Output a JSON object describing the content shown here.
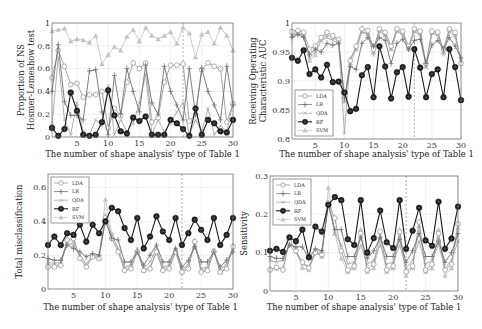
{
  "chart_data": [
    {
      "type": "line",
      "panel": "top-left",
      "title": "",
      "xlabel": "The number of shape analysis' type of Table 1",
      "ylabel": [
        "Proportion of NS",
        "Hosmer-Lemeshow test"
      ],
      "xlim": [
        1,
        30
      ],
      "ylim": [
        0,
        1
      ],
      "xticks": [
        5,
        10,
        15,
        20,
        25,
        30
      ],
      "yticks": [
        0,
        0.2,
        0.4,
        0.6,
        0.8,
        1
      ],
      "ytick_labels": [
        "0",
        "0.2",
        "0.4",
        "0.6",
        "0.8",
        "1"
      ],
      "grid": true,
      "vline_x": 22,
      "legend": null,
      "x": [
        1,
        2,
        3,
        4,
        5,
        6,
        7,
        8,
        9,
        10,
        11,
        12,
        13,
        14,
        15,
        16,
        17,
        18,
        19,
        20,
        21,
        22,
        23,
        24,
        25,
        26,
        27,
        28,
        29,
        30
      ],
      "series": [
        {
          "name": "LDA",
          "values": [
            0.52,
            0.76,
            0.62,
            0.46,
            0.47,
            0.35,
            0.37,
            0.37,
            0.4,
            0.08,
            0.25,
            0.19,
            0.48,
            0.65,
            0.6,
            0.65,
            0.13,
            0.17,
            0.48,
            0.63,
            0.63,
            0.64,
            0.14,
            0.2,
            0.59,
            0.65,
            0.62,
            0.6,
            0.13,
            0.29
          ]
        },
        {
          "name": "LR",
          "values": [
            0.4,
            0.81,
            0.31,
            0.19,
            0.19,
            0.15,
            0.58,
            0.59,
            0.22,
            0.02,
            0.54,
            0.2,
            0.6,
            0.4,
            0.22,
            0.63,
            0.3,
            0.2,
            0.62,
            0.4,
            0.28,
            0.15,
            0.6,
            0.2,
            0.6,
            0.4,
            0.28,
            0.15,
            0.62,
            0.28
          ]
        },
        {
          "name": "QDA",
          "values": [
            0.1,
            0.7,
            0.15,
            0.02,
            0.3,
            0.05,
            0.02,
            0.15,
            0.1,
            0.45,
            0.02,
            0.15,
            0.05,
            0.12,
            0.3,
            0.55,
            0.02,
            0.15,
            0.05,
            0.12,
            0.22,
            0.3,
            0.02,
            0.15,
            0.05,
            0.25,
            0.02,
            0.1,
            0.05,
            0.3
          ]
        },
        {
          "name": "RF",
          "values": [
            0.08,
            0.01,
            0.07,
            0.39,
            0.23,
            0.02,
            0.01,
            0.02,
            0.13,
            0.41,
            0.19,
            0.05,
            0.03,
            0.17,
            0.14,
            0.18,
            0.02,
            0.02,
            0.02,
            0.15,
            0.12,
            0.07,
            0.01,
            0.25,
            0.02,
            0.15,
            0.12,
            0.05,
            0.04,
            0.15
          ]
        },
        {
          "name": "SVM",
          "values": [
            0.93,
            0.94,
            0.95,
            0.84,
            0.86,
            0.85,
            0.83,
            0.89,
            0.64,
            0.72,
            0.79,
            0.76,
            0.88,
            0.94,
            0.84,
            0.96,
            0.89,
            0.86,
            0.89,
            0.92,
            0.82,
            0.96,
            0.91,
            0.7,
            0.9,
            0.92,
            0.82,
            0.96,
            0.89,
            0.76
          ]
        }
      ]
    },
    {
      "type": "line",
      "panel": "top-right",
      "title": "",
      "xlabel": "The number of shape analysis' type of Table 1",
      "ylabel": [
        "Receiving Operating",
        "Characteristic AUC"
      ],
      "xlim": [
        1,
        30
      ],
      "ylim": [
        0.8,
        1
      ],
      "xticks": [
        5,
        10,
        15,
        20,
        25,
        30
      ],
      "yticks": [
        0.8,
        0.85,
        0.9,
        0.95,
        1
      ],
      "ytick_labels": [
        "0.8",
        "0.85",
        "0.9",
        "0.95",
        "1"
      ],
      "grid": true,
      "vline_x": 22,
      "legend": "lower left",
      "x": [
        1,
        2,
        3,
        4,
        5,
        6,
        7,
        8,
        9,
        10,
        11,
        12,
        13,
        14,
        15,
        16,
        17,
        18,
        19,
        20,
        21,
        22,
        23,
        24,
        25,
        26,
        27,
        28,
        29,
        30
      ],
      "series": [
        {
          "name": "LDA",
          "values": [
            0.985,
            0.987,
            0.984,
            0.955,
            0.96,
            0.975,
            0.984,
            0.978,
            0.972,
            0.87,
            0.935,
            0.96,
            0.99,
            0.987,
            0.955,
            0.99,
            0.984,
            0.96,
            0.99,
            0.986,
            0.96,
            0.99,
            0.986,
            0.93,
            0.986,
            0.984,
            0.955,
            0.99,
            0.984,
            0.93
          ]
        },
        {
          "name": "LR",
          "values": [
            0.975,
            0.98,
            0.975,
            0.945,
            0.955,
            0.95,
            0.965,
            0.962,
            0.965,
            0.87,
            0.925,
            0.92,
            0.965,
            0.975,
            0.96,
            0.975,
            0.97,
            0.93,
            0.965,
            0.972,
            0.955,
            0.97,
            0.972,
            0.93,
            0.962,
            0.97,
            0.955,
            0.975,
            0.96,
            0.94
          ]
        },
        {
          "name": "QDA",
          "values": [
            0.978,
            0.982,
            0.978,
            0.94,
            0.95,
            0.97,
            0.975,
            0.97,
            0.965,
            0.81,
            0.94,
            0.955,
            0.985,
            0.98,
            0.945,
            0.985,
            0.978,
            0.955,
            0.985,
            0.98,
            0.955,
            0.985,
            0.98,
            0.925,
            0.982,
            0.98,
            0.945,
            0.985,
            0.975,
            0.935
          ]
        },
        {
          "name": "RF",
          "values": [
            0.94,
            0.935,
            0.953,
            0.912,
            0.92,
            0.906,
            0.928,
            0.898,
            0.899,
            0.88,
            0.848,
            0.852,
            0.91,
            0.924,
            0.872,
            0.96,
            0.925,
            0.87,
            0.915,
            0.924,
            0.873,
            0.955,
            0.923,
            0.872,
            0.912,
            0.92,
            0.872,
            0.955,
            0.924,
            0.867
          ]
        },
        {
          "name": "SVM",
          "values": [
            0.98,
            0.984,
            0.98,
            0.935,
            0.945,
            0.97,
            0.98,
            0.975,
            0.97,
            0.865,
            0.93,
            0.955,
            0.985,
            0.982,
            0.95,
            0.988,
            0.98,
            0.955,
            0.988,
            0.982,
            0.955,
            0.988,
            0.982,
            0.925,
            0.984,
            0.982,
            0.95,
            0.988,
            0.98,
            0.935
          ]
        }
      ]
    },
    {
      "type": "line",
      "panel": "bottom-left",
      "title": "",
      "xlabel": "The number of shape analysis' type of Table 1",
      "ylabel": [
        "Total misclassification"
      ],
      "xlim": [
        1,
        30
      ],
      "ylim": [
        0,
        0.68
      ],
      "xticks": [
        5,
        10,
        15,
        20,
        25,
        30
      ],
      "yticks": [
        0,
        0.2,
        0.4,
        0.6
      ],
      "ytick_labels": [
        "0",
        "0.2",
        "0.4",
        "0.6"
      ],
      "grid": true,
      "vline_x": 22,
      "legend": "upper left",
      "x": [
        1,
        2,
        3,
        4,
        5,
        6,
        7,
        8,
        9,
        10,
        11,
        12,
        13,
        14,
        15,
        16,
        17,
        18,
        19,
        20,
        21,
        22,
        23,
        24,
        25,
        26,
        27,
        28,
        29,
        30
      ],
      "series": [
        {
          "name": "LDA",
          "values": [
            0.13,
            0.13,
            0.14,
            0.29,
            0.3,
            0.18,
            0.13,
            0.19,
            0.18,
            0.42,
            0.3,
            0.22,
            0.11,
            0.12,
            0.22,
            0.11,
            0.12,
            0.22,
            0.11,
            0.12,
            0.22,
            0.1,
            0.12,
            0.28,
            0.1,
            0.11,
            0.22,
            0.1,
            0.12,
            0.25
          ]
        },
        {
          "name": "LR",
          "values": [
            0.18,
            0.17,
            0.17,
            0.26,
            0.24,
            0.22,
            0.19,
            0.21,
            0.2,
            0.4,
            0.3,
            0.29,
            0.16,
            0.16,
            0.22,
            0.14,
            0.2,
            0.26,
            0.16,
            0.16,
            0.24,
            0.13,
            0.17,
            0.25,
            0.16,
            0.16,
            0.22,
            0.13,
            0.17,
            0.22
          ]
        },
        {
          "name": "QDA",
          "values": [
            0.16,
            0.15,
            0.16,
            0.27,
            0.26,
            0.2,
            0.15,
            0.2,
            0.19,
            0.44,
            0.32,
            0.24,
            0.13,
            0.14,
            0.24,
            0.12,
            0.16,
            0.24,
            0.13,
            0.14,
            0.24,
            0.11,
            0.15,
            0.26,
            0.12,
            0.13,
            0.23,
            0.11,
            0.15,
            0.24
          ]
        },
        {
          "name": "RF",
          "values": [
            0.26,
            0.31,
            0.26,
            0.33,
            0.32,
            0.38,
            0.28,
            0.38,
            0.33,
            0.4,
            0.48,
            0.46,
            0.36,
            0.29,
            0.42,
            0.24,
            0.31,
            0.43,
            0.34,
            0.29,
            0.42,
            0.26,
            0.33,
            0.41,
            0.35,
            0.29,
            0.42,
            0.26,
            0.32,
            0.42
          ]
        },
        {
          "name": "SVM",
          "values": [
            0.15,
            0.14,
            0.15,
            0.3,
            0.28,
            0.19,
            0.14,
            0.19,
            0.18,
            0.53,
            0.33,
            0.23,
            0.12,
            0.13,
            0.23,
            0.11,
            0.13,
            0.23,
            0.12,
            0.13,
            0.23,
            0.1,
            0.13,
            0.29,
            0.11,
            0.12,
            0.23,
            0.1,
            0.13,
            0.26
          ]
        }
      ]
    },
    {
      "type": "line",
      "panel": "bottom-right",
      "title": "",
      "xlabel": "The number of shape analysis' type of Table 1",
      "ylabel": [
        "Sensitivity"
      ],
      "xlim": [
        1,
        30
      ],
      "ylim": [
        0,
        0.3
      ],
      "xticks": [
        5,
        10,
        15,
        20,
        25,
        30
      ],
      "yticks": [
        0,
        0.1,
        0.2,
        0.3
      ],
      "ytick_labels": [
        "0",
        "0.1",
        "0.2",
        "0.3"
      ],
      "grid": true,
      "vline_x": 22,
      "legend": "upper left",
      "x": [
        1,
        2,
        3,
        4,
        5,
        6,
        7,
        8,
        9,
        10,
        11,
        12,
        13,
        14,
        15,
        16,
        17,
        18,
        19,
        20,
        21,
        22,
        23,
        24,
        25,
        26,
        27,
        28,
        29,
        30
      ],
      "series": [
        {
          "name": "LDA",
          "values": [
            0.055,
            0.062,
            0.055,
            0.13,
            0.105,
            0.075,
            0.06,
            0.1,
            0.095,
            0.23,
            0.19,
            0.105,
            0.055,
            0.065,
            0.15,
            0.055,
            0.07,
            0.155,
            0.055,
            0.065,
            0.155,
            0.05,
            0.065,
            0.18,
            0.055,
            0.07,
            0.15,
            0.055,
            0.07,
            0.175
          ]
        },
        {
          "name": "LR",
          "values": [
            0.09,
            0.085,
            0.085,
            0.12,
            0.115,
            0.115,
            0.085,
            0.11,
            0.105,
            0.225,
            0.16,
            0.16,
            0.09,
            0.09,
            0.14,
            0.085,
            0.105,
            0.14,
            0.09,
            0.09,
            0.135,
            0.075,
            0.105,
            0.15,
            0.09,
            0.09,
            0.13,
            0.075,
            0.1,
            0.15
          ]
        },
        {
          "name": "QDA",
          "values": [
            0.08,
            0.075,
            0.08,
            0.12,
            0.1,
            0.07,
            0.065,
            0.105,
            0.1,
            0.23,
            0.15,
            0.12,
            0.07,
            0.075,
            0.12,
            0.07,
            0.08,
            0.12,
            0.07,
            0.075,
            0.12,
            0.06,
            0.08,
            0.13,
            0.07,
            0.08,
            0.12,
            0.06,
            0.08,
            0.13
          ]
        },
        {
          "name": "RF",
          "values": [
            0.105,
            0.11,
            0.102,
            0.14,
            0.13,
            0.16,
            0.088,
            0.168,
            0.155,
            0.225,
            0.245,
            0.237,
            0.135,
            0.12,
            0.237,
            0.1,
            0.138,
            0.21,
            0.127,
            0.112,
            0.237,
            0.11,
            0.157,
            0.217,
            0.132,
            0.118,
            0.233,
            0.11,
            0.137,
            0.22
          ]
        },
        {
          "name": "SVM",
          "values": [
            0.058,
            0.058,
            0.06,
            0.13,
            0.11,
            0.06,
            0.055,
            0.1,
            0.09,
            0.27,
            0.15,
            0.085,
            0.05,
            0.06,
            0.16,
            0.05,
            0.06,
            0.13,
            0.05,
            0.06,
            0.16,
            0.04,
            0.06,
            0.17,
            0.05,
            0.06,
            0.16,
            0.04,
            0.06,
            0.165
          ]
        }
      ]
    }
  ],
  "styles": {
    "LDA": {
      "color": "#9a9a9a",
      "marker": "circle-open"
    },
    "LR": {
      "color": "#707070",
      "marker": "plus"
    },
    "QDA": {
      "color": "#a8a8a8",
      "marker": "x"
    },
    "RF": {
      "color": "#1a1a1a",
      "marker": "circle-filled-cross"
    },
    "SVM": {
      "color": "#c4c4c4",
      "marker": "triangle"
    }
  },
  "panels_layout": [
    {
      "plot": [
        52,
        23,
        233,
        137
      ],
      "ylabel_x": [
        24,
        34
      ],
      "xlabel_y": 157
    },
    {
      "plot": [
        292,
        23,
        461,
        139
      ],
      "ylabel_x": [
        256,
        266
      ],
      "xlabel_y": 157
    },
    {
      "plot": [
        48,
        174,
        233,
        289
      ],
      "ylabel_x": [
        22
      ],
      "xlabel_y": 310
    },
    {
      "plot": [
        270,
        176,
        458,
        291
      ],
      "ylabel_x": [
        247
      ],
      "xlabel_y": 310
    }
  ]
}
